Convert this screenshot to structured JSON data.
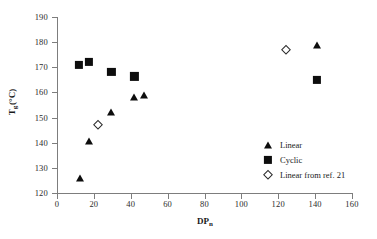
{
  "chart_data": {
    "type": "scatter",
    "title": "",
    "xlabel": "DPn",
    "xlabel_base": "DP",
    "xlabel_sub": "n",
    "ylabel": "Tg (°C)",
    "ylabel_base": "T",
    "ylabel_sub": "g",
    "ylabel_unit": "(°C)",
    "xlim": [
      0,
      160
    ],
    "ylim": [
      120,
      190
    ],
    "xticks": [
      0,
      20,
      40,
      60,
      80,
      100,
      120,
      140,
      160
    ],
    "yticks": [
      120,
      130,
      140,
      150,
      160,
      170,
      180,
      190
    ],
    "grid": false,
    "legend_position": "center-right",
    "series": [
      {
        "name": "Linear",
        "marker": "filled-triangle",
        "color": "#0d0d0d",
        "points": [
          {
            "x": 12.5,
            "y": 126.0
          },
          {
            "x": 17.5,
            "y": 140.8
          },
          {
            "x": 29.5,
            "y": 152.2
          },
          {
            "x": 42.0,
            "y": 158.1
          },
          {
            "x": 47.0,
            "y": 159.0
          },
          {
            "x": 141.0,
            "y": 178.9
          }
        ]
      },
      {
        "name": "Cyclic",
        "marker": "filled-square",
        "color": "#0d0d0d",
        "points": [
          {
            "x": 12.0,
            "y": 171.1
          },
          {
            "x": 17.5,
            "y": 172.2
          },
          {
            "x": 29.5,
            "y": 168.3
          },
          {
            "x": 42.0,
            "y": 166.4
          },
          {
            "x": 141.0,
            "y": 165.0
          }
        ]
      },
      {
        "name": "Linear from ref. 21",
        "marker": "open-diamond",
        "color": "#2a2a2a",
        "points": [
          {
            "x": 22.5,
            "y": 147.0
          },
          {
            "x": 124.0,
            "y": 176.9
          }
        ]
      }
    ]
  },
  "legend": {
    "entries": [
      {
        "label": "Linear",
        "marker": "filled-triangle"
      },
      {
        "label": "Cyclic",
        "marker": "filled-square"
      },
      {
        "label": "Linear from ref. 21",
        "marker": "open-diamond"
      }
    ]
  }
}
